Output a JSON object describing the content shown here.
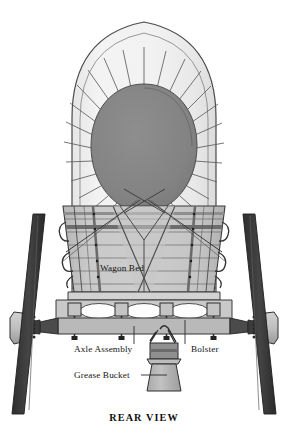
{
  "figure": {
    "caption": "REAR VIEW",
    "background_color": "#ffffff"
  },
  "labels": [
    {
      "id": "wagon-bed",
      "text": "Wagon Bed",
      "x": 122,
      "y": 271,
      "leader": false
    },
    {
      "id": "axle-assembly",
      "text": "Axle Assembly",
      "x": 74,
      "y": 352,
      "leader": true
    },
    {
      "id": "bolster",
      "text": "Bolster",
      "x": 191,
      "y": 352,
      "leader": true
    },
    {
      "id": "grease-bucket",
      "text": "Grease Bucket",
      "x": 74,
      "y": 378,
      "leader": true
    }
  ],
  "parts": [
    {
      "name": "canvas-bonnet",
      "description": "White canvas cover stretched over bows"
    },
    {
      "name": "puckered-opening",
      "description": "Dark gathered rear opening of the bonnet"
    },
    {
      "name": "pucker-rays",
      "description": "Radiating gather lines around the opening"
    },
    {
      "name": "wagon-bed",
      "description": "Planked wooden box body with iron straps"
    },
    {
      "name": "bed-bracing",
      "description": "Crossed diagonal braces over the tailgate"
    },
    {
      "name": "bolster",
      "description": "Transverse timber carrying the bed over the axle"
    },
    {
      "name": "axle-assembly",
      "description": "Axle, hubs, skeins and linchpins"
    },
    {
      "name": "wheel-left",
      "description": "Dished rear wheel, left side"
    },
    {
      "name": "wheel-right",
      "description": "Dished rear wheel, right side"
    },
    {
      "name": "grease-bucket",
      "description": "Tar bucket hung beneath the rear axle"
    }
  ],
  "palette": {
    "paper": "#ffffff",
    "canvas": "#efefef",
    "canvas_shade": "#e2e2e2",
    "opening_dark": "#828282",
    "wood_light": "#cfcfcf",
    "wood_mid": "#bdbdbd",
    "wood_dark": "#a6a6a6",
    "iron_dark": "#3a3a3a",
    "iron_mid": "#6e6e6e",
    "outline": "#3b3b3b",
    "text": "#141414"
  }
}
